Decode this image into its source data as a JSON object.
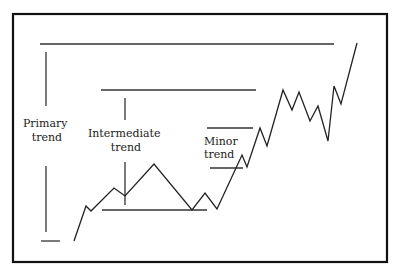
{
  "diagram": {
    "title": "",
    "frame": {
      "x": 13,
      "y": 14,
      "w": 374,
      "h": 248,
      "stroke": "#111111"
    },
    "colors": {
      "line": "#333333",
      "text": "#222222",
      "background": "#ffffff"
    },
    "labels": {
      "primary": [
        "Primary",
        "trend"
      ],
      "intermediate": [
        "Intermediate",
        "trend"
      ],
      "minor": [
        "Minor",
        "trend"
      ]
    },
    "price_path": [
      [
        74,
        241
      ],
      [
        86,
        206
      ],
      [
        91,
        211
      ],
      [
        114,
        188
      ],
      [
        125,
        196
      ],
      [
        154,
        164
      ],
      [
        192,
        210
      ],
      [
        205,
        193
      ],
      [
        217,
        209
      ],
      [
        242,
        155
      ],
      [
        247,
        167
      ],
      [
        260,
        128
      ],
      [
        267,
        146
      ],
      [
        283,
        90
      ],
      [
        292,
        110
      ],
      [
        299,
        92
      ],
      [
        310,
        121
      ],
      [
        318,
        106
      ],
      [
        328,
        141
      ],
      [
        334,
        86
      ],
      [
        341,
        104
      ],
      [
        357,
        43
      ]
    ],
    "trend_lines": {
      "primary_top": {
        "x1": 40,
        "y1": 44,
        "x2": 334,
        "y2": 44
      },
      "primary_bottom": {
        "x1": 41,
        "y1": 241,
        "x2": 60,
        "y2": 241
      },
      "intermediate_top": {
        "x1": 101,
        "y1": 90,
        "x2": 256,
        "y2": 90
      },
      "intermediate_bottom": {
        "x1": 102,
        "y1": 210,
        "x2": 207,
        "y2": 210
      },
      "minor_top": {
        "x1": 207,
        "y1": 128,
        "x2": 253,
        "y2": 128
      },
      "minor_bottom": {
        "x1": 210,
        "y1": 168,
        "x2": 243,
        "y2": 168
      }
    },
    "range_markers": {
      "primary": [
        {
          "x": 46,
          "y1": 52,
          "y2": 106
        },
        {
          "x": 46,
          "y1": 166,
          "y2": 232
        }
      ],
      "intermediate": [
        {
          "x": 125,
          "y1": 98,
          "y2": 120
        },
        {
          "x": 125,
          "y1": 162,
          "y2": 205
        }
      ]
    }
  }
}
